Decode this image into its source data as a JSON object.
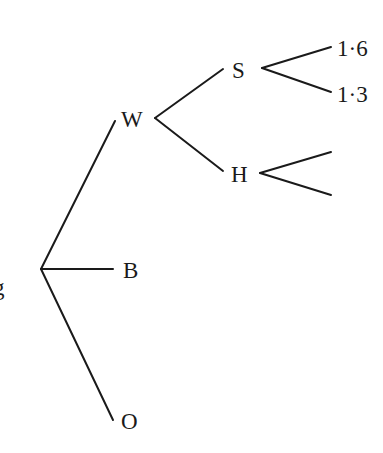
{
  "diagram": {
    "type": "probability-tree",
    "root": {
      "label": "g",
      "children": [
        {
          "label": "W",
          "children": [
            {
              "label": "S",
              "children": [
                {
                  "label": "1·6"
                },
                {
                  "label": "1·3"
                }
              ]
            },
            {
              "label": "H",
              "children": [
                {
                  "label": ""
                },
                {
                  "label": ""
                }
              ]
            }
          ]
        },
        {
          "label": "B"
        },
        {
          "label": "O"
        }
      ]
    },
    "line_color": "#1a1a1a",
    "background": "#ffffff"
  }
}
